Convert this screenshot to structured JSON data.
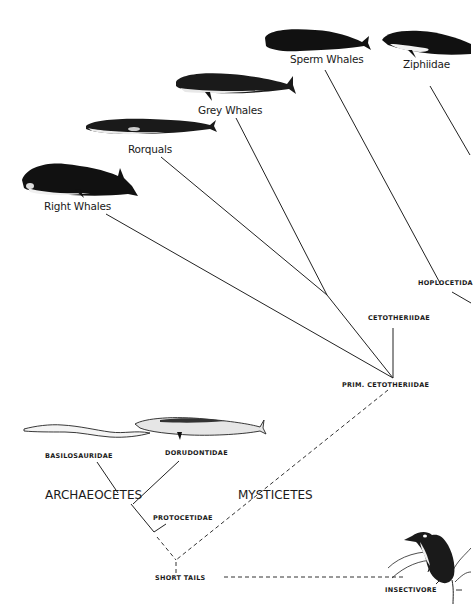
{
  "diagram": {
    "type": "phylogenetic-tree",
    "taxa": {
      "sperm_whales": "Sperm Whales",
      "ziphiidae": "Ziphiidae",
      "grey_whales": "Grey Whales",
      "rorquals": "Rorquals",
      "right_whales": "Right Whales",
      "hoplocetida": "HOPLOCETIDA",
      "cetotheriidae": "CETOTHERIIDAE",
      "prim_cetotheriidae": "PRIM. CETOTHERIIDAE",
      "basilosauridae": "BASILOSAURIDAE",
      "dorudontidae": "DORUDONTIDAE",
      "protocetidae": "PROTOCETIDAE",
      "short_tails": "SHORT TAILS",
      "insectivore": "INSECTIVORE"
    },
    "groups": {
      "archaeocetes": "ARCHAEOCETES",
      "mysticetes": "MYSTICETES"
    },
    "line_color": "#222222",
    "illustration_color": "#111111"
  }
}
